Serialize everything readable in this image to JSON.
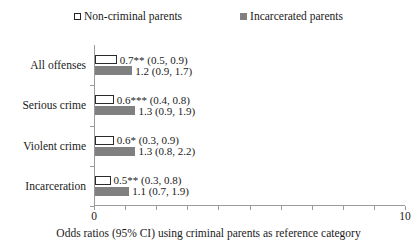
{
  "chart_data": {
    "type": "bar",
    "orientation": "horizontal",
    "title": "",
    "xlabel": "Odds ratios (95% CI) using criminal parents as reference category",
    "ylabel": "",
    "xlim": [
      0,
      10
    ],
    "xticks": [
      0,
      1,
      2,
      3,
      4,
      5,
      6,
      7,
      8,
      9,
      10
    ],
    "xticklabels": [
      "0",
      "",
      "",
      "",
      "",
      "",
      "",
      "",
      "",
      "",
      "10"
    ],
    "grid": false,
    "legend_position": "top",
    "categories": [
      "All offenses",
      "Serious crime",
      "Violent crime",
      "Incarceration"
    ],
    "series": [
      {
        "name": "Non-criminal parents",
        "style": "open",
        "color": "#ffffff",
        "edgecolor": "#2b2b2b",
        "values": [
          0.7,
          0.6,
          0.6,
          0.5
        ],
        "ci_low": [
          0.5,
          0.4,
          0.3,
          0.3
        ],
        "ci_high": [
          0.9,
          0.8,
          0.9,
          0.8
        ],
        "significance": [
          "**",
          "***",
          "*",
          "**"
        ],
        "labels": [
          "0.7** (0.5, 0.9)",
          "0.6*** (0.4, 0.8)",
          "0.6* (0.3, 0.9)",
          "0.5** (0.3, 0.8)"
        ]
      },
      {
        "name": "Incarcerated parents",
        "style": "filled",
        "color": "#808080",
        "edgecolor": "#808080",
        "values": [
          1.2,
          1.3,
          1.3,
          1.1
        ],
        "ci_low": [
          0.9,
          0.9,
          0.8,
          0.7
        ],
        "ci_high": [
          1.7,
          1.9,
          2.2,
          1.9
        ],
        "significance": [
          "",
          "",
          "",
          ""
        ],
        "labels": [
          "1.2 (0.9, 1.7)",
          "1.3 (0.9, 1.9)",
          "1.3 (0.8, 2.2)",
          "1.1 (0.7, 1.9)"
        ]
      }
    ]
  },
  "legend": {
    "items": [
      {
        "label": "Non-criminal parents",
        "marker": "open-square-marker"
      },
      {
        "label": "Incarcerated parents",
        "marker": "filled-square-marker"
      }
    ]
  },
  "axis": {
    "x_min_label": "0",
    "x_max_label": "10",
    "caption": "Odds ratios (95% CI) using criminal parents as reference category"
  }
}
